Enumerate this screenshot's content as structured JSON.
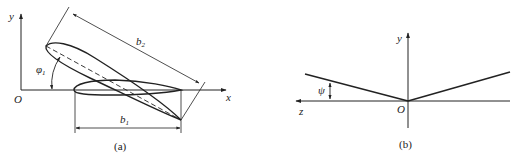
{
  "figure_a": {
    "caption": "(a)",
    "axis_x_label": "x",
    "axis_y_label": "y",
    "origin_label": "O",
    "dimension_b2": "b",
    "dimension_b2_sub": "2",
    "dimension_b1": "b",
    "dimension_b1_sub": "1",
    "angle_label": "φ",
    "angle_sub": "1"
  },
  "figure_b": {
    "caption": "(b)",
    "axis_z_label": "z",
    "axis_y_label": "y",
    "origin_label": "O",
    "angle_label": "ψ"
  },
  "colors": {
    "stroke": "#222222",
    "background": "#ffffff"
  }
}
